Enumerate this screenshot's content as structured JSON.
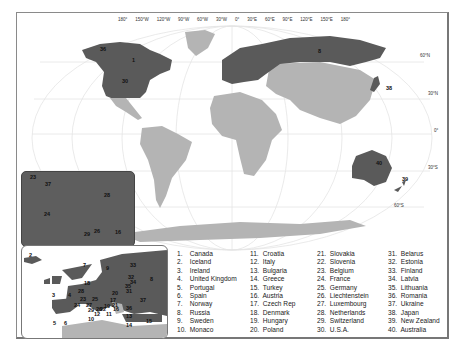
{
  "map": {
    "longitude_labels": [
      "180°",
      "150°W",
      "120°W",
      "90°W",
      "60°W",
      "30°W",
      "0°",
      "30°E",
      "60°E",
      "90°E",
      "120°E",
      "150°E",
      "180°"
    ],
    "latitude_labels": [
      "60°N",
      "30°N",
      "0°",
      "30°S",
      "60°S"
    ],
    "colors": {
      "highlighted": "#5a5a5a",
      "land": "#b4b4b4",
      "ocean": "#ffffff",
      "graticule": "#e6e6e6",
      "frame": "#888888"
    },
    "main_labels": [
      "36",
      "1",
      "30",
      "8",
      "38",
      "40",
      "39"
    ],
    "dark_inset_labels": [
      "23",
      "37",
      "28",
      "24",
      "29",
      "26",
      "16"
    ],
    "europe_inset_labels": [
      "2",
      "7",
      "9",
      "33",
      "32",
      "34",
      "35",
      "8",
      "18",
      "28",
      "3",
      "4",
      "23",
      "25",
      "20",
      "31",
      "17",
      "21",
      "37",
      "24",
      "27",
      "19",
      "22",
      "16",
      "26",
      "36",
      "29",
      "12",
      "11",
      "13",
      "10",
      "5",
      "6",
      "14",
      "15"
    ]
  },
  "legend": {
    "col1": [
      {
        "n": "1.",
        "name": "Canada"
      },
      {
        "n": "2.",
        "name": "Iceland"
      },
      {
        "n": "3.",
        "name": "Ireland"
      },
      {
        "n": "4.",
        "name": "United Kingdom"
      },
      {
        "n": "5.",
        "name": "Portugal"
      },
      {
        "n": "6.",
        "name": "Spain"
      },
      {
        "n": "7.",
        "name": "Norway"
      },
      {
        "n": "8.",
        "name": "Russia"
      },
      {
        "n": "9.",
        "name": "Sweden"
      },
      {
        "n": "10.",
        "name": "Monaco"
      }
    ],
    "col2": [
      {
        "n": "11.",
        "name": "Croatia"
      },
      {
        "n": "12.",
        "name": "Italy"
      },
      {
        "n": "13.",
        "name": "Bulgaria"
      },
      {
        "n": "14.",
        "name": "Greece"
      },
      {
        "n": "15.",
        "name": "Turkey"
      },
      {
        "n": "16.",
        "name": "Austria"
      },
      {
        "n": "17.",
        "name": "Czech Rep"
      },
      {
        "n": "18.",
        "name": "Denmark"
      },
      {
        "n": "19.",
        "name": "Hungary"
      },
      {
        "n": "20.",
        "name": "Poland"
      }
    ],
    "col3": [
      {
        "n": "21.",
        "name": "Slovakia"
      },
      {
        "n": "22.",
        "name": "Slovenia"
      },
      {
        "n": "23.",
        "name": "Belgium"
      },
      {
        "n": "24.",
        "name": "France"
      },
      {
        "n": "25.",
        "name": "Germany"
      },
      {
        "n": "26.",
        "name": "Liechtenstein"
      },
      {
        "n": "27.",
        "name": "Luxembourg"
      },
      {
        "n": "28.",
        "name": "Netherlands"
      },
      {
        "n": "29.",
        "name": "Switzerland"
      },
      {
        "n": "30.",
        "name": "U.S.A."
      }
    ],
    "col4": [
      {
        "n": "31.",
        "name": "Belarus"
      },
      {
        "n": "32.",
        "name": "Estonia"
      },
      {
        "n": "33.",
        "name": "Finland"
      },
      {
        "n": "34.",
        "name": "Latvia"
      },
      {
        "n": "35.",
        "name": "Lithuania"
      },
      {
        "n": "36.",
        "name": "Romania"
      },
      {
        "n": "37.",
        "name": "Ukraine"
      },
      {
        "n": "38.",
        "name": "Japan"
      },
      {
        "n": "39.",
        "name": "New Zealand"
      },
      {
        "n": "40.",
        "name": "Australia"
      }
    ]
  }
}
